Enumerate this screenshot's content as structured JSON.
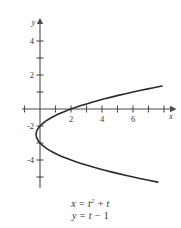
{
  "chart_data": {
    "type": "line",
    "title": "",
    "subtitle": "",
    "xlabel": "x",
    "ylabel": "y",
    "xlim": [
      -1.2,
      8.5
    ],
    "ylim": [
      -5.3,
      5.3
    ],
    "grid": false,
    "legend": null,
    "parametric": {
      "x_equation": "x = t² + t",
      "y_equation": "y = t − 1",
      "t_range": [
        -3.3,
        2.5
      ]
    },
    "x_ticks": [
      -1,
      0,
      1,
      2,
      3,
      4,
      5,
      6,
      7
    ],
    "x_tick_labels": [
      "",
      "",
      "",
      "2",
      "",
      "4",
      "",
      "6",
      ""
    ],
    "y_ticks": [
      -4,
      -3,
      -2,
      -1,
      0,
      1,
      2,
      3,
      4
    ],
    "y_tick_labels": [
      "-4",
      "",
      "-2",
      "",
      "",
      "",
      "2",
      "",
      "4"
    ],
    "series": [
      {
        "name": "x = t^2 + t, y = t - 1",
        "points": [
          {
            "t": -3.3,
            "x": 7.59,
            "y": -4.3
          },
          {
            "t": -3.1,
            "x": 6.51,
            "y": -4.1
          },
          {
            "t": -2.9,
            "x": 5.51,
            "y": -3.9
          },
          {
            "t": -2.7,
            "x": 4.59,
            "y": -3.7
          },
          {
            "t": -2.5,
            "x": 3.75,
            "y": -3.5
          },
          {
            "t": -2.3,
            "x": 2.99,
            "y": -3.3
          },
          {
            "t": -2.1,
            "x": 2.31,
            "y": -3.1
          },
          {
            "t": -1.9,
            "x": 1.71,
            "y": -2.9
          },
          {
            "t": -1.7,
            "x": 1.19,
            "y": -2.7
          },
          {
            "t": -1.5,
            "x": 0.75,
            "y": -2.5
          },
          {
            "t": -1.3,
            "x": 0.39,
            "y": -2.3
          },
          {
            "t": -1.1,
            "x": 0.11,
            "y": -2.1
          },
          {
            "t": -0.9,
            "x": -0.09,
            "y": -1.9
          },
          {
            "t": -0.7,
            "x": -0.21,
            "y": -1.7
          },
          {
            "t": -0.5,
            "x": -0.25,
            "y": -1.5
          },
          {
            "t": -0.3,
            "x": -0.21,
            "y": -1.3
          },
          {
            "t": -0.1,
            "x": -0.09,
            "y": -1.1
          },
          {
            "t": 0.1,
            "x": 0.11,
            "y": -0.9
          },
          {
            "t": 0.3,
            "x": 0.39,
            "y": -0.7
          },
          {
            "t": 0.5,
            "x": 0.75,
            "y": -0.5
          },
          {
            "t": 0.7,
            "x": 1.19,
            "y": -0.3
          },
          {
            "t": 0.9,
            "x": 1.71,
            "y": -0.1
          },
          {
            "t": 1.0,
            "x": 2.0,
            "y": 0.0
          },
          {
            "t": 1.2,
            "x": 2.64,
            "y": 0.2
          },
          {
            "t": 1.4,
            "x": 3.36,
            "y": 0.4
          },
          {
            "t": 1.6,
            "x": 4.16,
            "y": 0.6
          },
          {
            "t": 1.8,
            "x": 5.04,
            "y": 0.8
          },
          {
            "t": 2.0,
            "x": 6.0,
            "y": 1.0
          },
          {
            "t": 2.2,
            "x": 7.04,
            "y": 1.2
          },
          {
            "t": 2.35,
            "x": 7.87,
            "y": 1.35
          }
        ]
      }
    ],
    "annotations": {
      "vertex": {
        "x": -0.25,
        "y": -1.5
      },
      "x_intercept": {
        "x": 2,
        "y": 0
      }
    },
    "colors": {
      "curve": "#2b2b2b",
      "axis": "#4a4a52",
      "label": "#3a3a42",
      "background": "#ffffff"
    }
  },
  "axis_labels": {
    "x": "x",
    "y": "y"
  },
  "caption": {
    "line1_lhs": "x",
    "line1_eq": "=",
    "line1_base": "t",
    "line1_exp": "2",
    "line1_plus": "+",
    "line1_tail": "t",
    "line2_lhs": "y",
    "line2_eq": "=",
    "line2_base": "t",
    "line2_minus": "−",
    "line2_tail": "1"
  }
}
